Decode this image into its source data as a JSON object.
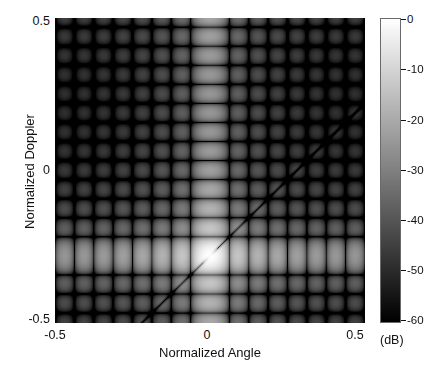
{
  "figure": {
    "width": 439,
    "height": 369,
    "background": "#ffffff"
  },
  "axes": {
    "x": {
      "label": "Normalized Angle",
      "ticks": [
        "-0.5",
        "0",
        "0.5"
      ],
      "tick_values": [
        -0.5,
        0,
        0.5
      ],
      "range": [
        -0.5,
        0.5
      ]
    },
    "y": {
      "label": "Normalized Doppler",
      "ticks": [
        "0.5",
        "0",
        "-0.5"
      ],
      "tick_values": [
        0.5,
        0,
        -0.5
      ],
      "range": [
        -0.5,
        0.5
      ]
    }
  },
  "colorbar": {
    "units_label": "(dB)",
    "ticks": [
      "0",
      "-10",
      "-20",
      "-30",
      "-40",
      "-50",
      "-60"
    ],
    "tick_values": [
      0,
      -10,
      -20,
      -30,
      -40,
      -50,
      -60
    ],
    "range": [
      -60,
      0
    ],
    "colormap": "gray",
    "low_color": "#000000",
    "high_color": "#ffffff",
    "orientation": "vertical"
  },
  "chart_data": {
    "type": "heatmap",
    "title": "",
    "xlabel": "Normalized Angle",
    "ylabel": "Normalized Doppler",
    "zlabel": "(dB)",
    "xlim": [
      -0.5,
      0.5
    ],
    "ylim": [
      -0.5,
      0.5
    ],
    "zlim": [
      -60,
      0
    ],
    "colormap": "gray",
    "grid": false,
    "legend": "colorbar-right",
    "peak": {
      "normalized_angle": 0.0,
      "normalized_doppler": -0.28,
      "value_db": 0
    },
    "features": [
      {
        "name": "mainlobe-peak",
        "x": 0.0,
        "y": -0.28,
        "value_db": 0
      },
      {
        "name": "diagonal-null-ridge",
        "slope": 1.0,
        "intercept": -0.28,
        "value_db": -60
      },
      {
        "name": "vertical-mainlobe-stripe",
        "x": 0.0,
        "value_db": -10
      },
      {
        "name": "horizontal-mainlobe-stripe",
        "y": -0.28,
        "value_db": -10
      }
    ],
    "sidelobe_period_x": 0.0625,
    "sidelobe_period_y": 0.0625,
    "n_elements": 16,
    "n_pulses": 16,
    "samples_db": [
      {
        "x": 0.0,
        "y": -0.28,
        "z": 0
      },
      {
        "x": 0.0,
        "y": 0.0,
        "z": -32
      },
      {
        "x": 0.0,
        "y": 0.5,
        "z": -14
      },
      {
        "x": -0.5,
        "y": -0.28,
        "z": -16
      },
      {
        "x": 0.5,
        "y": -0.28,
        "z": -15
      },
      {
        "x": -0.5,
        "y": 0.5,
        "z": -52
      },
      {
        "x": 0.5,
        "y": 0.5,
        "z": -50
      },
      {
        "x": -0.5,
        "y": -0.5,
        "z": -34
      },
      {
        "x": 0.5,
        "y": -0.5,
        "z": -33
      },
      {
        "x": -0.25,
        "y": -0.03,
        "z": -27
      },
      {
        "x": 0.25,
        "y": -0.03,
        "z": -40
      }
    ]
  }
}
